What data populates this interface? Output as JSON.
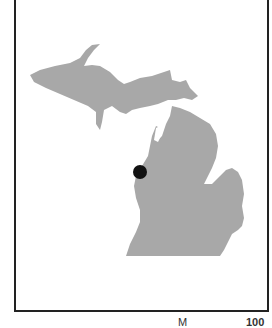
{
  "map": {
    "region": "Michigan",
    "land_color": "#a8a8a8",
    "marker_color": "#111111",
    "marker": {
      "label": "Location marker",
      "cx": 140,
      "cy": 172,
      "r": 7
    }
  },
  "caption": {
    "left": "M",
    "right": "100"
  }
}
